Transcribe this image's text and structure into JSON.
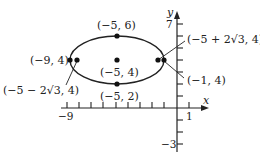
{
  "figure": {
    "type": "ellipse-graph",
    "axes": {
      "x_label": "x",
      "y_label": "y",
      "x_tick_labels": [
        "−9",
        "1"
      ],
      "y_tick_labels": [
        "7",
        "−3"
      ],
      "x_range": [
        -9,
        1
      ],
      "y_range": [
        -3,
        7
      ]
    },
    "ellipse": {
      "center": [
        -5,
        4
      ],
      "semi_major": 4,
      "semi_minor": 2
    },
    "points": [
      {
        "id": "top-vertex",
        "label": "(−5, 6)",
        "x": -5,
        "y": 6
      },
      {
        "id": "center",
        "label": "(−5, 4)",
        "x": -5,
        "y": 4
      },
      {
        "id": "bottom-vertex",
        "label": "(−5, 2)",
        "x": -5,
        "y": 2
      },
      {
        "id": "left-vertex",
        "label": "(−9, 4)",
        "x": -9,
        "y": 4
      },
      {
        "id": "right-vertex",
        "label": "(−1, 4)",
        "x": -1,
        "y": 4
      },
      {
        "id": "left-focus",
        "label": "(−5 − 2√3, 4)",
        "x": -8.464,
        "y": 4
      },
      {
        "id": "right-focus",
        "label": "(−5 + 2√3, 4)",
        "x": -1.536,
        "y": 4
      }
    ]
  },
  "labels": {
    "top": "(−5, 6)",
    "center": "(−5, 4)",
    "bottom": "(−5, 2)",
    "left_vertex": "(−9, 4)",
    "right_vertex": "(−1, 4)",
    "left_focus": "(−5 − 2√3, 4)",
    "right_focus": "(−5 + 2√3, 4)",
    "x_min": "−9",
    "x_one": "1",
    "y_seven": "7",
    "y_neg_three": "−3",
    "x_axis": "x",
    "y_axis": "y"
  }
}
